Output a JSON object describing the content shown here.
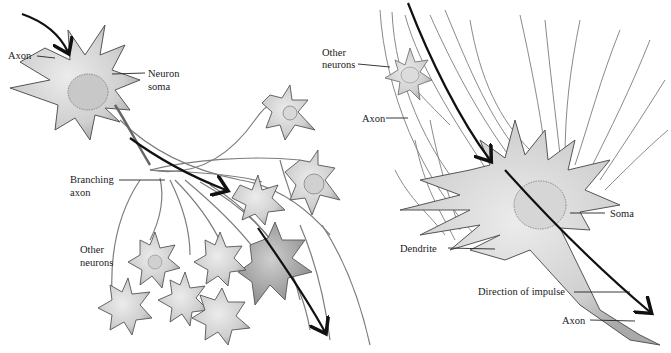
{
  "figure": {
    "left_panel": {
      "description": "Neuron with branching axon connecting to other neurons",
      "labels": {
        "axon": "Axon",
        "neuron_soma_line1": "Neuron",
        "neuron_soma_line2": "soma",
        "branching_axon_line1": "Branching",
        "branching_axon_line2": "axon",
        "other_neurons_line1": "Other",
        "other_neurons_line2": "neurons"
      }
    },
    "right_panel": {
      "description": "Single neuron receiving inputs, impulse direction shown",
      "labels": {
        "other_neurons_line1": "Other",
        "other_neurons_line2": "neurons",
        "axon_top": "Axon",
        "soma": "Soma",
        "dendrite": "Dendrite",
        "direction_of_impulse": "Direction of impulse",
        "axon_bottom": "Axon"
      }
    },
    "colors": {
      "ink": "#1a1a1a",
      "cell_fill": "#d9d9d9",
      "cell_shade": "#bdbdbd",
      "fiber": "#8a8a8a",
      "arrow": "#111111"
    }
  }
}
